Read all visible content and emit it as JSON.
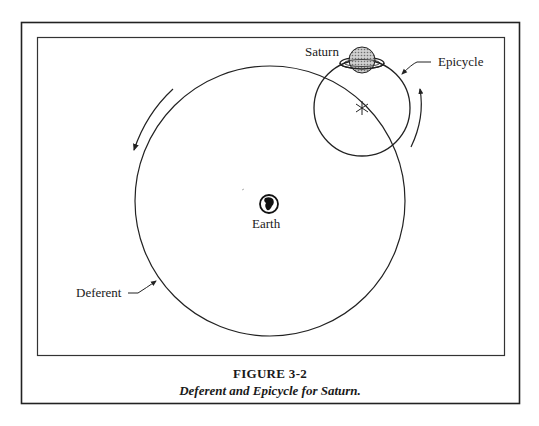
{
  "figure": {
    "number": "FIGURE 3-2",
    "caption": "Deferent and Epicycle for Saturn."
  },
  "labels": {
    "saturn": "Saturn",
    "epicycle": "Epicycle",
    "earth": "Earth",
    "deferent": "Deferent"
  },
  "geometry": {
    "deferent": {
      "cx": 270,
      "cy": 201,
      "r": 135
    },
    "epicycle": {
      "cx": 362,
      "cy": 108,
      "r": 48
    },
    "saturn": {
      "cx": 362,
      "cy": 60,
      "r": 13
    },
    "earth": {
      "cx": 269,
      "cy": 204,
      "r": 9
    }
  },
  "colors": {
    "line": "#222222",
    "saturn_fill": "#a9a9a9",
    "background": "#ffffff"
  }
}
